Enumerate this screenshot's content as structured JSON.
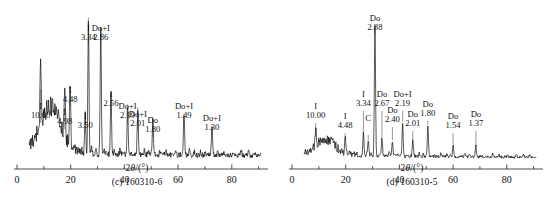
{
  "figure": {
    "axis_label": "2θ/(°)",
    "axis_label_italic": "θ",
    "axis_label_pre": "2",
    "axis_label_post": "/(°)"
  },
  "panels": [
    {
      "id": "panel-c",
      "caption": "(c) 160310-6",
      "chart_data": {
        "type": "line",
        "title": "(c) 160310-6",
        "xlabel": "2θ/(°)",
        "ylabel": "",
        "xlim": [
          0,
          92
        ],
        "xticks": [
          0,
          20,
          40,
          60,
          80
        ],
        "xticklabels": [
          "0",
          "20",
          "40",
          "60",
          "80"
        ],
        "minor_xticks": [
          10,
          30,
          50,
          70,
          90
        ],
        "grid": false,
        "legend": null,
        "annotations": [
          {
            "mineral": "I",
            "d": "10.00",
            "two_theta": 8.8,
            "height": 0.42
          },
          {
            "mineral": "I",
            "d": "4.98",
            "two_theta": 17.8,
            "height": 0.3
          },
          {
            "mineral": "I",
            "d": "4.48",
            "two_theta": 19.8,
            "height": 0.4
          },
          {
            "mineral": "I",
            "d": "3.50",
            "two_theta": 25.4,
            "height": 0.28
          },
          {
            "mineral": "I",
            "d": "3.34",
            "two_theta": 26.6,
            "height": 0.88
          },
          {
            "mineral": "Do+I",
            "d": "2.86",
            "two_theta": 31.2,
            "height": 0.82
          },
          {
            "mineral": "I",
            "d": "2.56",
            "two_theta": 35.0,
            "height": 0.4
          },
          {
            "mineral": "Do+I",
            "d": "2.19",
            "two_theta": 41.2,
            "height": 0.32
          },
          {
            "mineral": "Do+I",
            "d": "2.01",
            "two_theta": 45.0,
            "height": 0.3
          },
          {
            "mineral": "Do",
            "d": "1.80",
            "two_theta": 50.6,
            "height": 0.24
          },
          {
            "mineral": "Do+I",
            "d": "1.49",
            "two_theta": 62.2,
            "height": 0.26
          },
          {
            "mineral": "Do+I",
            "d": "1.30",
            "two_theta": 72.6,
            "height": 0.18
          }
        ],
        "broad_hump": {
          "center": 12.5,
          "width": 5.5,
          "height": 0.3
        },
        "baseline": 0.045,
        "noise": 0.022
      }
    },
    {
      "id": "panel-d",
      "caption": "(d) 160310-5",
      "chart_data": {
        "type": "line",
        "title": "(d) 160310-5",
        "xlabel": "2θ/(°)",
        "ylabel": "",
        "xlim": [
          0,
          92
        ],
        "xticks": [
          0,
          20,
          40,
          60,
          80
        ],
        "xticklabels": [
          "0",
          "20",
          "40",
          "60",
          "80"
        ],
        "minor_xticks": [
          10,
          30,
          50,
          70,
          90
        ],
        "grid": false,
        "legend": null,
        "annotations": [
          {
            "mineral": "I",
            "d": "10.00",
            "two_theta": 8.8,
            "height": 0.12
          },
          {
            "mineral": "I",
            "d": "4.48",
            "two_theta": 19.8,
            "height": 0.1
          },
          {
            "mineral": "I",
            "d": "3.34",
            "two_theta": 26.6,
            "height": 0.16
          },
          {
            "mineral": "C",
            "d": "",
            "two_theta": 28.4,
            "height": 0.1
          },
          {
            "mineral": "Do",
            "d": "2.88",
            "two_theta": 30.9,
            "height": 0.84
          },
          {
            "mineral": "Do",
            "d": "2.67",
            "two_theta": 33.5,
            "height": 0.12
          },
          {
            "mineral": "Do",
            "d": "2.40",
            "two_theta": 37.4,
            "height": 0.1
          },
          {
            "mineral": "Do+I",
            "d": "2.19",
            "two_theta": 41.2,
            "height": 0.22
          },
          {
            "mineral": "Do",
            "d": "2.01",
            "two_theta": 45.0,
            "height": 0.1
          },
          {
            "mineral": "Do",
            "d": "1.80",
            "two_theta": 50.6,
            "height": 0.2
          },
          {
            "mineral": "Do",
            "d": "1.54",
            "two_theta": 60.0,
            "height": 0.07
          },
          {
            "mineral": "Do",
            "d": "1.37",
            "two_theta": 68.5,
            "height": 0.06
          }
        ],
        "broad_hump": {
          "center": 12.5,
          "width": 5.0,
          "height": 0.1
        },
        "baseline": 0.035,
        "noise": 0.012
      }
    }
  ]
}
